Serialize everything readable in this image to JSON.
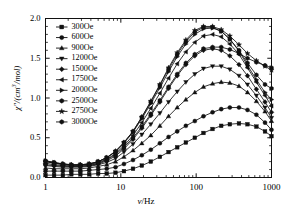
{
  "chart_data": {
    "type": "line",
    "title": "",
    "xlabel": "ν/Hz",
    "ylabel": "χ″/(cm³/mol)",
    "xscale": "log",
    "xlim": [
      1,
      1000
    ],
    "ylim": [
      0.0,
      2.0
    ],
    "grid": false,
    "legend_position": "upper-left-inside",
    "xticks": [
      1,
      10,
      100,
      1000
    ],
    "xtick_labels": [
      "1",
      "10",
      "100",
      "1000"
    ],
    "yticks": [
      0.0,
      0.5,
      1.0,
      1.5,
      2.0
    ],
    "ytick_labels": [
      "0.0",
      "0.5",
      "1.0",
      "1.5",
      "2.0"
    ],
    "series": [
      {
        "name": "300Oe",
        "marker": "square",
        "x": [
          1,
          1.3,
          1.7,
          2.2,
          2.9,
          3.8,
          5,
          6.5,
          8.5,
          11,
          14.5,
          19,
          25,
          33,
          43,
          56,
          73,
          96,
          125,
          165,
          215,
          280,
          370,
          480,
          630,
          820,
          1000
        ],
        "y": [
          0.03,
          0.03,
          0.03,
          0.04,
          0.04,
          0.04,
          0.05,
          0.05,
          0.06,
          0.08,
          0.11,
          0.15,
          0.2,
          0.26,
          0.32,
          0.38,
          0.44,
          0.5,
          0.56,
          0.61,
          0.65,
          0.67,
          0.68,
          0.67,
          0.64,
          0.58,
          0.52
        ]
      },
      {
        "name": "600Oe",
        "marker": "circle",
        "x": [
          1,
          1.3,
          1.7,
          2.2,
          2.9,
          3.8,
          5,
          6.5,
          8.5,
          11,
          14.5,
          19,
          25,
          33,
          43,
          56,
          73,
          96,
          125,
          165,
          215,
          280,
          370,
          480,
          630,
          820,
          1000
        ],
        "y": [
          0.08,
          0.08,
          0.08,
          0.08,
          0.08,
          0.09,
          0.1,
          0.11,
          0.13,
          0.17,
          0.22,
          0.28,
          0.35,
          0.43,
          0.51,
          0.58,
          0.65,
          0.71,
          0.77,
          0.82,
          0.86,
          0.88,
          0.88,
          0.85,
          0.79,
          0.69,
          0.6
        ]
      },
      {
        "name": "900Oe",
        "marker": "triangle-up",
        "x": [
          1,
          1.3,
          1.7,
          2.2,
          2.9,
          3.8,
          5,
          6.5,
          8.5,
          11,
          14.5,
          19,
          25,
          33,
          43,
          56,
          73,
          96,
          125,
          165,
          215,
          280,
          370,
          480,
          630,
          820,
          1000
        ],
        "y": [
          0.12,
          0.11,
          0.11,
          0.11,
          0.11,
          0.12,
          0.14,
          0.16,
          0.2,
          0.26,
          0.34,
          0.43,
          0.53,
          0.65,
          0.77,
          0.88,
          0.98,
          1.07,
          1.14,
          1.18,
          1.2,
          1.19,
          1.15,
          1.07,
          0.96,
          0.83,
          0.71
        ]
      },
      {
        "name": "1200Oe",
        "marker": "triangle-down",
        "x": [
          1,
          1.3,
          1.7,
          2.2,
          2.9,
          3.8,
          5,
          6.5,
          8.5,
          11,
          14.5,
          19,
          25,
          33,
          43,
          56,
          73,
          96,
          125,
          165,
          215,
          280,
          370,
          480,
          630,
          820,
          1000
        ],
        "y": [
          0.15,
          0.14,
          0.13,
          0.13,
          0.13,
          0.14,
          0.16,
          0.19,
          0.24,
          0.32,
          0.42,
          0.54,
          0.67,
          0.81,
          0.95,
          1.08,
          1.2,
          1.3,
          1.37,
          1.4,
          1.4,
          1.36,
          1.28,
          1.17,
          1.03,
          0.88,
          0.75
        ]
      },
      {
        "name": "1500Oe",
        "marker": "diamond",
        "x": [
          1,
          1.3,
          1.7,
          2.2,
          2.9,
          3.8,
          5,
          6.5,
          8.5,
          11,
          14.5,
          19,
          25,
          33,
          43,
          56,
          73,
          96,
          125,
          165,
          215,
          280,
          370,
          480,
          630,
          820,
          1000
        ],
        "y": [
          0.18,
          0.16,
          0.15,
          0.14,
          0.14,
          0.15,
          0.17,
          0.21,
          0.27,
          0.36,
          0.48,
          0.62,
          0.78,
          0.95,
          1.12,
          1.28,
          1.42,
          1.53,
          1.6,
          1.62,
          1.6,
          1.53,
          1.42,
          1.28,
          1.11,
          0.95,
          0.82
        ]
      },
      {
        "name": "1750Oe",
        "marker": "triangle-left",
        "x": [
          1,
          1.3,
          1.7,
          2.2,
          2.9,
          3.8,
          5,
          6.5,
          8.5,
          11,
          14.5,
          19,
          25,
          33,
          43,
          56,
          73,
          96,
          125,
          165,
          215,
          280,
          370,
          480,
          630,
          820,
          1000
        ],
        "y": [
          0.2,
          0.18,
          0.16,
          0.15,
          0.15,
          0.16,
          0.19,
          0.23,
          0.3,
          0.4,
          0.53,
          0.69,
          0.87,
          1.06,
          1.25,
          1.43,
          1.58,
          1.7,
          1.78,
          1.8,
          1.77,
          1.68,
          1.55,
          1.38,
          1.2,
          1.03,
          0.9
        ]
      },
      {
        "name": "2000Oe",
        "marker": "triangle-right",
        "x": [
          1,
          1.3,
          1.7,
          2.2,
          2.9,
          3.8,
          5,
          6.5,
          8.5,
          11,
          14.5,
          19,
          25,
          33,
          43,
          56,
          73,
          96,
          125,
          165,
          215,
          280,
          370,
          480,
          630,
          820,
          1000
        ],
        "y": [
          0.21,
          0.19,
          0.17,
          0.16,
          0.16,
          0.17,
          0.2,
          0.25,
          0.32,
          0.43,
          0.57,
          0.74,
          0.93,
          1.13,
          1.33,
          1.52,
          1.68,
          1.8,
          1.87,
          1.88,
          1.84,
          1.74,
          1.59,
          1.41,
          1.23,
          1.07,
          0.98
        ]
      },
      {
        "name": "2500Oe",
        "marker": "hexagon",
        "x": [
          1,
          1.3,
          1.7,
          2.2,
          2.9,
          3.8,
          5,
          6.5,
          8.5,
          11,
          14.5,
          19,
          25,
          33,
          43,
          56,
          73,
          96,
          125,
          165,
          215,
          280,
          370,
          480,
          630,
          820,
          1000
        ],
        "y": [
          0.21,
          0.19,
          0.17,
          0.16,
          0.16,
          0.17,
          0.2,
          0.25,
          0.33,
          0.44,
          0.58,
          0.76,
          0.95,
          1.16,
          1.36,
          1.55,
          1.71,
          1.83,
          1.89,
          1.89,
          1.84,
          1.74,
          1.6,
          1.44,
          1.29,
          1.17,
          1.12
        ]
      },
      {
        "name": "2750Oe",
        "marker": "star",
        "x": [
          1,
          1.3,
          1.7,
          2.2,
          2.9,
          3.8,
          5,
          6.5,
          8.5,
          11,
          14.5,
          19,
          25,
          33,
          43,
          56,
          73,
          96,
          125,
          165,
          215,
          280,
          370,
          480,
          630,
          820,
          1000
        ],
        "y": [
          0.2,
          0.18,
          0.17,
          0.16,
          0.16,
          0.17,
          0.2,
          0.25,
          0.33,
          0.44,
          0.58,
          0.76,
          0.96,
          1.17,
          1.38,
          1.57,
          1.73,
          1.85,
          1.9,
          1.9,
          1.86,
          1.78,
          1.67,
          1.56,
          1.47,
          1.4,
          1.35
        ]
      },
      {
        "name": "3000Oe",
        "marker": "hexagon",
        "x": [
          1,
          1.3,
          1.7,
          2.2,
          2.9,
          3.8,
          5,
          6.5,
          8.5,
          11,
          14.5,
          19,
          25,
          33,
          43,
          56,
          73,
          96,
          125,
          165,
          215,
          280,
          370,
          480,
          630,
          820,
          1000
        ],
        "y": [
          0.16,
          0.15,
          0.14,
          0.14,
          0.14,
          0.15,
          0.18,
          0.22,
          0.29,
          0.38,
          0.5,
          0.64,
          0.8,
          0.97,
          1.14,
          1.3,
          1.44,
          1.55,
          1.62,
          1.64,
          1.64,
          1.61,
          1.56,
          1.5,
          1.45,
          1.41,
          1.38
        ]
      }
    ]
  },
  "legend": {
    "items": [
      {
        "label": "300Oe",
        "marker": "square"
      },
      {
        "label": "600Oe",
        "marker": "circle"
      },
      {
        "label": "900Oe",
        "marker": "triangle-up"
      },
      {
        "label": "1200Oe",
        "marker": "triangle-down"
      },
      {
        "label": "1500Oe",
        "marker": "diamond"
      },
      {
        "label": "1750Oe",
        "marker": "triangle-left"
      },
      {
        "label": "2000Oe",
        "marker": "triangle-right"
      },
      {
        "label": "2500Oe",
        "marker": "hexagon"
      },
      {
        "label": "2750Oe",
        "marker": "star"
      },
      {
        "label": "3000Oe",
        "marker": "hexagon"
      }
    ]
  },
  "axis_text": {
    "ylabel_chi": "χ",
    "ylabel_primes": "″",
    "ylabel_rest_a": "/(cm",
    "ylabel_exp": "3",
    "ylabel_rest_b": "/mol)",
    "xlabel_nu": "ν",
    "xlabel_rest": "/Hz"
  },
  "style": {
    "ink": "#111111",
    "background": "#ffffff"
  }
}
